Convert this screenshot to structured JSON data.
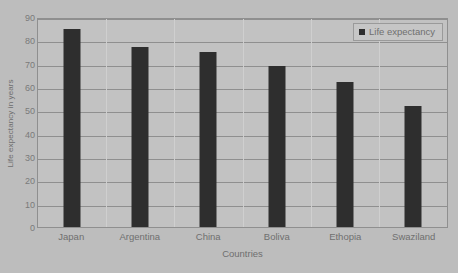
{
  "chart_data": {
    "type": "bar",
    "title": "",
    "categories": [
      "Japan",
      "Argentina",
      "China",
      "Boliva",
      "Ethopia",
      "Swaziland"
    ],
    "values": [
      85,
      77,
      75,
      69,
      62,
      52
    ],
    "series": [
      {
        "name": "Life expectancy",
        "values": [
          85,
          77,
          75,
          69,
          62,
          52
        ]
      }
    ],
    "xlabel": "Countries",
    "ylabel": "Life expectancy in years",
    "ylim": [
      0,
      90
    ],
    "ytick_step": 10,
    "yticks": [
      0,
      10,
      20,
      30,
      40,
      50,
      60,
      70,
      80,
      90
    ],
    "ytick_labels": [
      "0",
      "10",
      "20",
      "30",
      "40",
      "50",
      "60",
      "70",
      "80",
      "90"
    ],
    "grid": true,
    "grid_axis": "y",
    "legend": [
      "Life expectancy"
    ],
    "legend_position": "top-right",
    "bar_color": "#2e2e2e",
    "plot_background": "#c2c2c2",
    "figure_background": "#bdbdbd",
    "axis_color": "#8f8f8f",
    "text_color": "#6f6f6f"
  },
  "legend": {
    "label": "Life expectancy"
  },
  "axes": {
    "x_title": "Countries",
    "y_title": "Life expectancy in years"
  }
}
